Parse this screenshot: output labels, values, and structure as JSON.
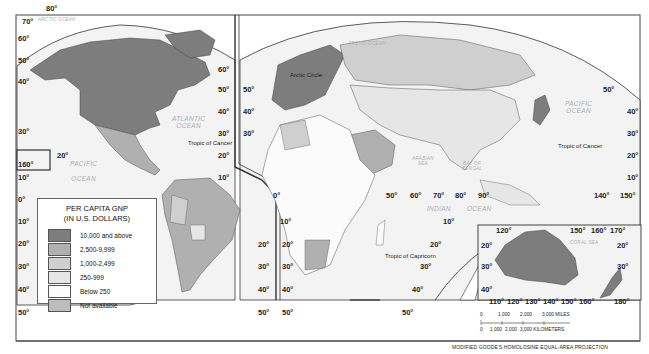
{
  "map": {
    "title": "Per Capita GNP",
    "projection": "MODIFIED GOODE'S HOMOLOSINE EQUAL-AREA PROJECTION",
    "oceans": {
      "arctic_left": "ARCTIC OCEAN",
      "arctic_right": "ARCTIC OCEAN",
      "atlantic_1": "ATLANTIC",
      "atlantic_2": "OCEAN",
      "pacific_left_1": "PACIFIC",
      "pacific_left_2": "OCEAN",
      "pacific_right_1": "PACIFIC",
      "pacific_right_2": "OCEAN",
      "indian_1": "INDIAN",
      "indian_2": "OCEAN",
      "arabian_sea_1": "ARABIAN",
      "arabian_sea_2": "SEA",
      "bay_bengal_1": "BAY OF",
      "bay_bengal_2": "BENGAL",
      "coral_sea": "CORAL SEA"
    },
    "lines": {
      "arctic_circle": "Arctic Circle",
      "tropic_cancer_left": "Tropic of Cancer",
      "tropic_cancer_right": "Tropic of Cancer",
      "tropic_capricorn": "Tropic of Capricorn"
    },
    "lat_labels": {
      "na_left": [
        "60°",
        "50°",
        "40°",
        "30°",
        "10°",
        "0°",
        "10°",
        "20°",
        "30°",
        "40°",
        "50°"
      ],
      "na_top": [
        "80°",
        "70°"
      ],
      "hawaii": [
        "160°",
        "20°"
      ],
      "am_right": [
        "60°",
        "50°",
        "40°",
        "30°",
        "20°",
        "10°",
        "20°",
        "30°",
        "40°",
        "50°"
      ],
      "euro_left": [
        "50°",
        "40°",
        "30°",
        "0°",
        "10°",
        "20°",
        "30°",
        "40°",
        "50°"
      ],
      "eq_lon": [
        "50°",
        "60°",
        "70°",
        "80°",
        "90°"
      ],
      "indian_lat": [
        "10°",
        "20°",
        "30°",
        "40°",
        "50°"
      ],
      "asia_right": [
        "50°",
        "40°",
        "30°",
        "20°",
        "10°"
      ],
      "asia_lon": [
        "140°",
        "150°"
      ],
      "aus_top": [
        "120°",
        "150°",
        "160°",
        "170°"
      ],
      "aus_left": [
        "20°",
        "30°",
        "40°"
      ],
      "aus_right": [
        "20°",
        "30°"
      ],
      "aus_bottom": [
        "110°",
        "120°",
        "130°",
        "140°",
        "150°",
        "160°",
        "180°"
      ]
    },
    "colors": {
      "ocean": "#f4f4f4",
      "grid": "#ffffff",
      "border": "#555555",
      "frame": "#333333"
    }
  },
  "legend": {
    "title_1": "PER CAPITA GNP",
    "title_2": "(IN U.S. DOLLARS)",
    "items": [
      {
        "label": "10,000 and above",
        "color": "#7d7d7d"
      },
      {
        "label": "2,500-9,999",
        "color": "#b0b0b0"
      },
      {
        "label": "1,000-2,499",
        "color": "#cfcfcf"
      },
      {
        "label": "250-999",
        "color": "#e6e6e6"
      },
      {
        "label": "Below 250",
        "color": "#fbfbfb"
      },
      {
        "label": "Not available",
        "color": "#bdbdbd"
      }
    ]
  },
  "scale": {
    "miles": [
      "0",
      "1,000",
      "2,000",
      "3,000 MILES"
    ],
    "kilometers": [
      "0",
      "1,000",
      "2,000",
      "3,000 KILOMETERS"
    ]
  }
}
